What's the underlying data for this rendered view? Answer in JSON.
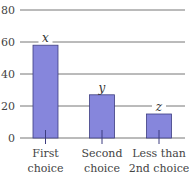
{
  "chart_data": {
    "type": "bar",
    "title": "",
    "xlabel": "",
    "ylabel": "",
    "categories": [
      "First choice",
      "Second choice",
      "Less than 2nd choice"
    ],
    "category_lines": [
      [
        "First",
        "choice"
      ],
      [
        "Second",
        "choice"
      ],
      [
        "Less than",
        "2nd choice"
      ]
    ],
    "values": [
      58,
      27,
      15
    ],
    "bar_labels": [
      "x",
      "y",
      "z"
    ],
    "ylim": [
      0,
      80
    ],
    "yticks": [
      0,
      20,
      40,
      60,
      80
    ],
    "grid": true,
    "legend": null,
    "colors": {
      "bar_fill": "#8686dc",
      "bar_stroke": "#3d3d80",
      "grid": "#777777"
    }
  }
}
